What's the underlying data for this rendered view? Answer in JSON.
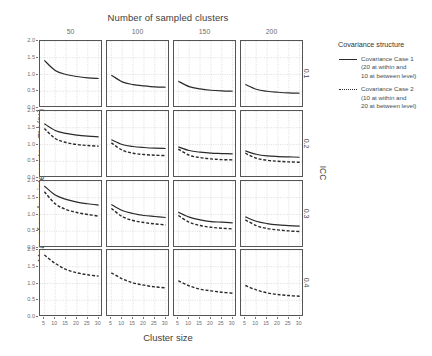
{
  "chart_data": {
    "type": "line",
    "title": "",
    "xlabel": "Cluster size",
    "ylabel": "Mean of random intercepts—CV (%)",
    "top_facet_label": "Number of sampled clusters",
    "right_facet_label": "ICC",
    "grid": true,
    "legend_position": "right",
    "xlim": [
      3,
      32
    ],
    "ylim": [
      0,
      2.0
    ],
    "xticks": [
      "5",
      "10",
      "15",
      "20",
      "25",
      "30"
    ],
    "xtick_values": [
      5,
      10,
      15,
      20,
      25,
      30
    ],
    "yticks": [
      "0.0",
      "0.5",
      "1.0",
      "1.5",
      "2.0"
    ],
    "ytick_values": [
      0.0,
      0.5,
      1.0,
      1.5,
      2.0
    ],
    "col_facets": [
      "50",
      "100",
      "150",
      "200"
    ],
    "row_facets": [
      "0.1",
      "0.2",
      "0.3",
      "0.4"
    ],
    "x": [
      5,
      10,
      15,
      20,
      25,
      30
    ],
    "panels": [
      {
        "row": "0.1",
        "col": "50",
        "series": [
          {
            "name": "Covariance Case 1",
            "style": "solid",
            "values": [
              1.42,
              1.12,
              1.0,
              0.94,
              0.9,
              0.88
            ]
          }
        ]
      },
      {
        "row": "0.1",
        "col": "100",
        "series": [
          {
            "name": "Covariance Case 1",
            "style": "solid",
            "values": [
              0.98,
              0.78,
              0.7,
              0.66,
              0.63,
              0.62
            ]
          }
        ]
      },
      {
        "row": "0.1",
        "col": "150",
        "series": [
          {
            "name": "Covariance Case 1",
            "style": "solid",
            "values": [
              0.8,
              0.64,
              0.57,
              0.53,
              0.51,
              0.5
            ]
          }
        ]
      },
      {
        "row": "0.1",
        "col": "200",
        "series": [
          {
            "name": "Covariance Case 1",
            "style": "solid",
            "values": [
              0.7,
              0.56,
              0.5,
              0.47,
              0.45,
              0.44
            ]
          }
        ]
      },
      {
        "row": "0.2",
        "col": "50",
        "series": [
          {
            "name": "Covariance Case 1",
            "style": "solid",
            "values": [
              1.62,
              1.42,
              1.33,
              1.28,
              1.25,
              1.23
            ]
          },
          {
            "name": "Covariance Case 2",
            "style": "dashed",
            "values": [
              1.48,
              1.18,
              1.06,
              1.0,
              0.97,
              0.95
            ]
          }
        ]
      },
      {
        "row": "0.2",
        "col": "100",
        "series": [
          {
            "name": "Covariance Case 1",
            "style": "solid",
            "values": [
              1.14,
              1.0,
              0.94,
              0.91,
              0.89,
              0.88
            ]
          },
          {
            "name": "Covariance Case 2",
            "style": "dashed",
            "values": [
              1.05,
              0.83,
              0.74,
              0.7,
              0.68,
              0.67
            ]
          }
        ]
      },
      {
        "row": "0.2",
        "col": "150",
        "series": [
          {
            "name": "Covariance Case 1",
            "style": "solid",
            "values": [
              0.93,
              0.82,
              0.77,
              0.74,
              0.73,
              0.72
            ]
          },
          {
            "name": "Covariance Case 2",
            "style": "dashed",
            "values": [
              0.86,
              0.68,
              0.61,
              0.57,
              0.55,
              0.54
            ]
          }
        ]
      },
      {
        "row": "0.2",
        "col": "200",
        "series": [
          {
            "name": "Covariance Case 1",
            "style": "solid",
            "values": [
              0.81,
              0.71,
              0.66,
              0.64,
              0.63,
              0.62
            ]
          },
          {
            "name": "Covariance Case 2",
            "style": "dashed",
            "values": [
              0.74,
              0.59,
              0.53,
              0.5,
              0.48,
              0.47
            ]
          }
        ]
      },
      {
        "row": "0.3",
        "col": "50",
        "series": [
          {
            "name": "Covariance Case 1",
            "style": "solid",
            "values": [
              1.85,
              1.58,
              1.45,
              1.37,
              1.32,
              1.28
            ]
          },
          {
            "name": "Covariance Case 2",
            "style": "dashed",
            "values": [
              1.68,
              1.32,
              1.15,
              1.06,
              1.0,
              0.95
            ]
          }
        ]
      },
      {
        "row": "0.3",
        "col": "100",
        "series": [
          {
            "name": "Covariance Case 1",
            "style": "solid",
            "values": [
              1.3,
              1.12,
              1.03,
              0.97,
              0.94,
              0.91
            ]
          },
          {
            "name": "Covariance Case 2",
            "style": "dashed",
            "values": [
              1.18,
              0.94,
              0.82,
              0.76,
              0.72,
              0.69
            ]
          }
        ]
      },
      {
        "row": "0.3",
        "col": "150",
        "series": [
          {
            "name": "Covariance Case 1",
            "style": "solid",
            "values": [
              1.07,
              0.92,
              0.84,
              0.79,
              0.77,
              0.75
            ]
          },
          {
            "name": "Covariance Case 2",
            "style": "dashed",
            "values": [
              0.97,
              0.77,
              0.67,
              0.62,
              0.59,
              0.57
            ]
          }
        ]
      },
      {
        "row": "0.3",
        "col": "200",
        "series": [
          {
            "name": "Covariance Case 1",
            "style": "solid",
            "values": [
              0.93,
              0.8,
              0.73,
              0.69,
              0.67,
              0.65
            ]
          },
          {
            "name": "Covariance Case 2",
            "style": "dashed",
            "values": [
              0.84,
              0.67,
              0.58,
              0.54,
              0.51,
              0.49
            ]
          }
        ]
      },
      {
        "row": "0.4",
        "col": "50",
        "series": [
          {
            "name": "Covariance Case 2",
            "style": "dashed",
            "values": [
              1.85,
              1.6,
              1.42,
              1.32,
              1.26,
              1.22
            ]
          }
        ]
      },
      {
        "row": "0.4",
        "col": "100",
        "series": [
          {
            "name": "Covariance Case 2",
            "style": "dashed",
            "values": [
              1.32,
              1.14,
              1.02,
              0.95,
              0.9,
              0.87
            ]
          }
        ]
      },
      {
        "row": "0.4",
        "col": "150",
        "series": [
          {
            "name": "Covariance Case 2",
            "style": "dashed",
            "values": [
              1.08,
              0.93,
              0.83,
              0.78,
              0.74,
              0.71
            ]
          }
        ]
      },
      {
        "row": "0.4",
        "col": "200",
        "series": [
          {
            "name": "Covariance Case 2",
            "style": "dashed",
            "values": [
              0.94,
              0.81,
              0.72,
              0.67,
              0.64,
              0.62
            ]
          }
        ]
      }
    ]
  },
  "legend": {
    "title": "Covariance structure",
    "entries": [
      {
        "style": "solid",
        "lines": [
          "Covariance Case 1",
          "(20 at within and",
          "10 at between level)"
        ]
      },
      {
        "style": "dotted",
        "lines": [
          "Covariance Case 2",
          "(10 at within and",
          "20 at between level)"
        ]
      }
    ]
  },
  "colors": {
    "line": "#2a2a2a",
    "grid": "#c9c9c9",
    "panel_border": "#555555",
    "text": "#3d3d3d",
    "tick_text": "#6d6d6d",
    "background": "#ffffff"
  }
}
